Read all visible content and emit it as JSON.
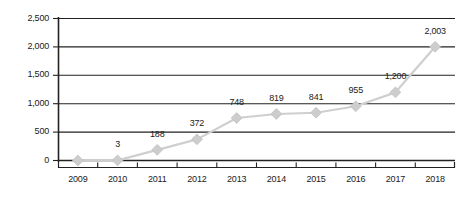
{
  "chart_data": {
    "type": "line",
    "title": "",
    "subtitle": "",
    "xlabel": "",
    "ylabel": "",
    "categories": [
      "2009",
      "2010",
      "2011",
      "2012",
      "2013",
      "2014",
      "2015",
      "2016",
      "2017",
      "2018"
    ],
    "values": [
      0,
      3,
      188,
      372,
      748,
      819,
      841,
      955,
      1200,
      2003
    ],
    "point_labels": [
      "",
      "3",
      "188",
      "372",
      "748",
      "819",
      "841",
      "955",
      "1,200",
      "2,003"
    ],
    "ylim": [
      0,
      2500
    ],
    "ytick_values": [
      0,
      500,
      1000,
      1500,
      2000,
      2500
    ],
    "ytick_labels": [
      "0",
      "500",
      "1,000",
      "1,500",
      "2,000",
      "2,500"
    ],
    "grid": true,
    "grid_axis": "y",
    "legend": false,
    "legend_position": "none",
    "series": [
      {
        "name": "",
        "values": [
          0,
          3,
          188,
          372,
          748,
          819,
          841,
          955,
          1200,
          2003
        ],
        "line_color": "#cfcfcf",
        "marker": "diamond",
        "marker_color": "#cdcdcd"
      }
    ],
    "colors": {
      "line": "#cfcfcf",
      "marker": "#cdcdcd",
      "marker_edge": "#c2c2c2",
      "gridline": "#222222",
      "axis": "#222222",
      "text": "#1a1a1a",
      "background": "#ffffff"
    }
  }
}
